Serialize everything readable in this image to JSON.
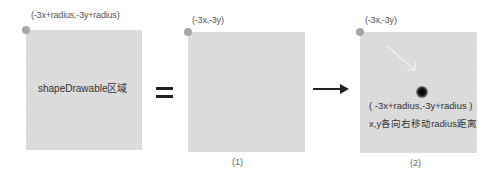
{
  "panels": [
    {
      "coord_label": "(-3x+radius,-3y+radius)",
      "body_text": "shapeDrawable区域",
      "caption": ""
    },
    {
      "coord_label": "(-3x,-3y)",
      "body_text": "",
      "caption": "(1)"
    },
    {
      "coord_label": "(-3x,-3y)",
      "body_text_line1": "( -3x+radius,-3y+radius )",
      "body_text_line2": "x,y各向右移动radius距离",
      "caption": "(2)"
    }
  ],
  "operators": {
    "equals": "=",
    "arrow": "→"
  },
  "colors": {
    "box_fill": "#dcdcdc",
    "corner_dot": "#a6a6a6",
    "shadow_dot": "#000000",
    "operator": "#222222"
  }
}
